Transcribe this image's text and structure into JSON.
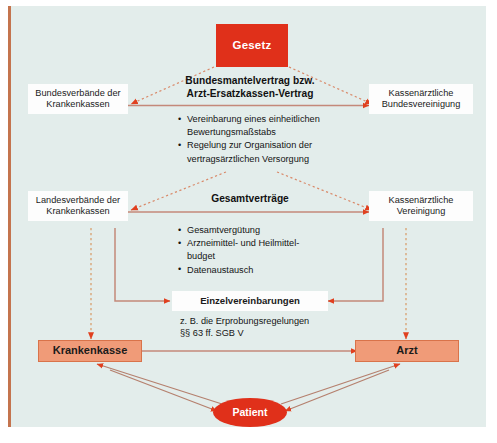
{
  "diagram": {
    "title": "Gesetz",
    "background_color": "#e3edeb",
    "accent_red": "#e0301a",
    "accent_salmon": "#f09b78",
    "frame_border_color": "#c4744e"
  },
  "nodes": {
    "gesetz": {
      "label": "Gesetz"
    },
    "bundesverbaende": {
      "line1": "Bundesverbände der",
      "line2": "Krankenkassen"
    },
    "kbv": {
      "line1": "Kassenärztliche",
      "line2": "Bundesvereinigung"
    },
    "landesverbaende": {
      "line1": "Landesverbände der",
      "line2": "Krankenkassen"
    },
    "kv": {
      "line1": "Kassenärztliche",
      "line2": "Vereinigung"
    },
    "krankenkasse": {
      "label": "Krankenkasse"
    },
    "arzt": {
      "label": "Arzt"
    },
    "patient": {
      "label": "Patient"
    },
    "einzelvereinbarungen": {
      "label": "Einzelvereinbarungen"
    }
  },
  "sections": {
    "bundesmantelvertrag": {
      "heading_line1": "Bundesmantelvertrag bzw.",
      "heading_line2": "Arzt-Ersatzkassen-Vertrag",
      "bullets": [
        {
          "text": "Vereinbarung eines einheitlichen",
          "bulleted": true
        },
        {
          "text": "Bewertungsmaßstabs",
          "bulleted": false
        },
        {
          "text": "Regelung zur Organisation der",
          "bulleted": true
        },
        {
          "text": "vertragsärztlichen Versorgung",
          "bulleted": false
        }
      ]
    },
    "gesamtvertraege": {
      "heading_line1": "Gesamtverträge",
      "bullets": [
        {
          "text": "Gesamtvergütung",
          "bulleted": true
        },
        {
          "text": "Arzneimittel- und Heilmittel-",
          "bulleted": true
        },
        {
          "text": "budget",
          "bulleted": false
        },
        {
          "text": "Datenaustausch",
          "bulleted": true
        }
      ]
    },
    "einzel_note": {
      "line1": "z. B. die Erprobungsregelungen",
      "line2": "§§ 63 ff. SGB V"
    }
  }
}
